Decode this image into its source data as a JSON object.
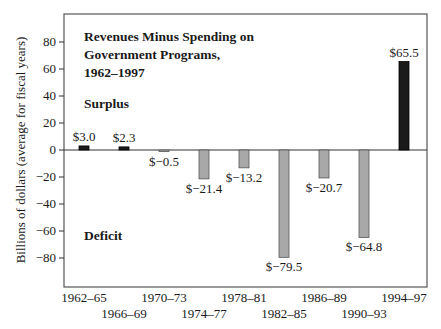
{
  "chart_data": {
    "type": "bar",
    "title": "Revenues Minus Spending on Government Programs, 1962–1997",
    "title_lines": [
      "Revenues Minus Spending on",
      "Government Programs,",
      "1962–1997"
    ],
    "xlabel": "",
    "ylabel": "Billions of dollars (average for fiscal years)",
    "categories": [
      "1962–65",
      "1966–69",
      "1970–73",
      "1974–77",
      "1978–81",
      "1982–85",
      "1986–89",
      "1990–93",
      "1994–97"
    ],
    "values": [
      3.0,
      2.3,
      -0.5,
      -21.4,
      -13.2,
      -79.5,
      -20.7,
      -64.8,
      65.5
    ],
    "value_labels": [
      "$3.0",
      "$2.3",
      "$−0.5",
      "$−21.4",
      "$−13.2",
      "$−79.5",
      "$−20.7",
      "$−64.8",
      "$65.5"
    ],
    "yticks": [
      80,
      60,
      40,
      20,
      0,
      -20,
      -40,
      -60,
      -80
    ],
    "ytick_labels": [
      "80",
      "60",
      "40",
      "20",
      "0",
      "−20",
      "−40",
      "−60",
      "−80"
    ],
    "ylim": [
      -100,
      90
    ],
    "grid": false,
    "annotations": [
      "Surplus",
      "Deficit"
    ],
    "colors": {
      "surplus": "#1a1a1a",
      "deficit": "#a8a8a8",
      "highlight": "#1a1a1a",
      "frame": "#555555"
    }
  }
}
